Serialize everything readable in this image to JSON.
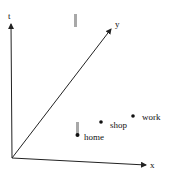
{
  "diagram": {
    "type": "space-time-cube",
    "axes": {
      "t": {
        "label": "t"
      },
      "x": {
        "label": "x"
      },
      "y": {
        "label": "y"
      }
    },
    "locations": [
      {
        "id": "home",
        "label": "home"
      },
      {
        "id": "shop",
        "label": "shop"
      },
      {
        "id": "work",
        "label": "work"
      }
    ],
    "bars": [
      {
        "id": "bar-upper",
        "description": "gray vertical bar (time interval) above home"
      },
      {
        "id": "bar-home",
        "description": "gray vertical bar (time interval) at home"
      }
    ],
    "colors": {
      "axis": "#222222",
      "bar": "#a8a8a8",
      "point": "#111111",
      "background": "#ffffff"
    }
  }
}
